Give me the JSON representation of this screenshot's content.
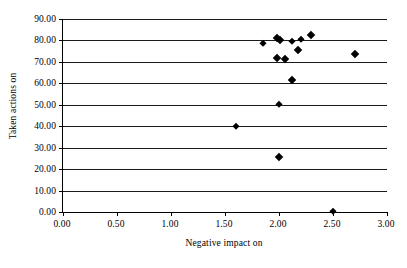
{
  "chart_data": {
    "type": "scatter",
    "title": "",
    "xlabel": "Negative impact on",
    "ylabel": "Taken actions on",
    "xlim": [
      0.0,
      3.0
    ],
    "ylim": [
      0.0,
      90.0
    ],
    "x_ticks": [
      "0.00",
      "0.50",
      "1.00",
      "1.50",
      "2.00",
      "2.50",
      "3.00"
    ],
    "x_tick_values": [
      0.0,
      0.5,
      1.0,
      1.5,
      2.0,
      2.5,
      3.0
    ],
    "y_ticks": [
      "0.00",
      "10.00",
      "20.00",
      "30.00",
      "40.00",
      "50.00",
      "60.00",
      "70.00",
      "80.00",
      "90.00"
    ],
    "y_tick_values": [
      0,
      10,
      20,
      30,
      40,
      50,
      60,
      70,
      80,
      90
    ],
    "grid": "horizontal",
    "legend": "none",
    "marker": "diamond",
    "marker_color": "#000000",
    "series": [
      {
        "name": "points",
        "points": [
          {
            "x": 1.85,
            "y": 79.0,
            "size": "small"
          },
          {
            "x": 1.98,
            "y": 81.0,
            "size": "large"
          },
          {
            "x": 2.01,
            "y": 80.4,
            "size": "large"
          },
          {
            "x": 2.12,
            "y": 79.6,
            "size": "small"
          },
          {
            "x": 2.2,
            "y": 80.5,
            "size": "small"
          },
          {
            "x": 2.3,
            "y": 82.5,
            "size": "large"
          },
          {
            "x": 2.18,
            "y": 75.6,
            "size": "large"
          },
          {
            "x": 2.7,
            "y": 73.7,
            "size": "large"
          },
          {
            "x": 1.98,
            "y": 72.0,
            "size": "large"
          },
          {
            "x": 2.06,
            "y": 71.4,
            "size": "large"
          },
          {
            "x": 2.12,
            "y": 61.4,
            "size": "large"
          },
          {
            "x": 2.0,
            "y": 50.5,
            "size": "small"
          },
          {
            "x": 1.6,
            "y": 40.3,
            "size": "small"
          },
          {
            "x": 2.0,
            "y": 25.5,
            "size": "large"
          },
          {
            "x": 2.5,
            "y": 0.4,
            "size": "small"
          }
        ]
      }
    ]
  }
}
